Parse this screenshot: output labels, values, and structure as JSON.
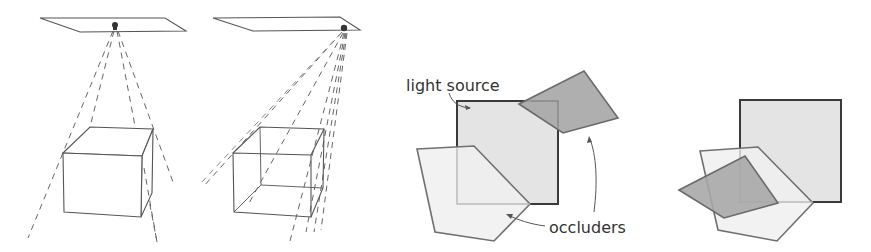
{
  "figure": {
    "panels": [
      {
        "id": "point-light-panel",
        "description": "Point light source above a box, casting shadow rays",
        "plate": [
          [
            40,
            18
          ],
          [
            165,
            18
          ],
          [
            186,
            31
          ],
          [
            80,
            32
          ]
        ],
        "light": [
          115,
          26
        ],
        "box": {
          "front": [
            [
              63,
              153
            ],
            [
              142,
              156
            ],
            [
              141,
              217
            ],
            [
              64,
              212
            ]
          ],
          "back_top_left": [
            90,
            127
          ],
          "back_top_right": [
            153,
            129
          ],
          "back_bottom_right": [
            152,
            193
          ]
        },
        "rays": [
          [
            28,
            238
          ],
          [
            90,
            127
          ],
          [
            157,
            242
          ],
          [
            173,
            182
          ]
        ]
      },
      {
        "id": "area-light-panel",
        "description": "Area light source at plate corner, many rays through transparent box",
        "plate": [
          [
            213,
            18
          ],
          [
            340,
            17
          ],
          [
            360,
            30
          ],
          [
            253,
            31
          ]
        ],
        "light": [
          344,
          28
        ],
        "box": {
          "front": [
            [
              233,
              153
            ],
            [
              311,
              155
            ],
            [
              311,
              217
            ],
            [
              234,
              212
            ]
          ],
          "back_top_left": [
            260,
            127
          ],
          "back_top_right": [
            324,
            129
          ],
          "back_bottom_left": [
            261,
            185
          ],
          "back_bottom_right": [
            323,
            188
          ]
        },
        "rays": [
          [
            203,
            187
          ],
          [
            248,
            205
          ],
          [
            290,
            241
          ],
          [
            306,
            232
          ],
          [
            314,
            232
          ],
          [
            321,
            230
          ]
        ]
      },
      {
        "id": "light-source-occluders-panel",
        "square": [
          [
            457,
            101
          ],
          [
            558,
            101
          ],
          [
            558,
            204
          ],
          [
            457,
            204
          ]
        ],
        "pentagon": [
          [
            417,
            149
          ],
          [
            474,
            146
          ],
          [
            530,
            204
          ],
          [
            494,
            241
          ],
          [
            435,
            232
          ]
        ],
        "dark_quad": [
          [
            519,
            104
          ],
          [
            584,
            71
          ],
          [
            618,
            118
          ],
          [
            563,
            133
          ]
        ]
      },
      {
        "id": "occluders-overlap-panel",
        "square": [
          [
            740,
            100
          ],
          [
            841,
            100
          ],
          [
            841,
            202
          ],
          [
            740,
            202
          ]
        ],
        "pentagon": [
          [
            700,
            151
          ],
          [
            758,
            147
          ],
          [
            813,
            203
          ],
          [
            777,
            241
          ],
          [
            718,
            230
          ]
        ],
        "dark_quad": [
          [
            679,
            190
          ],
          [
            745,
            156
          ],
          [
            778,
            203
          ],
          [
            724,
            218
          ]
        ]
      }
    ],
    "labels": {
      "light_source": "light source",
      "occluders": "occluders"
    },
    "colors": {
      "line": "#555555",
      "square_fill": "#e6e6e6",
      "pentagon_fill": "#efefef",
      "dark_fill": "#a8a8a8",
      "square_stroke": "#3a3a3a",
      "occluder_stroke": "#6e6e6e"
    }
  }
}
